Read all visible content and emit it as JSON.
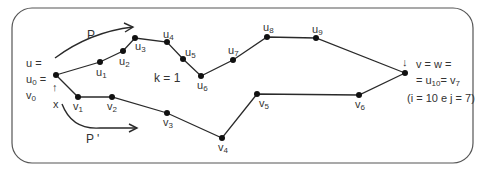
{
  "diagram": {
    "path_labels": {
      "p": "P",
      "p_prime": "P '"
    },
    "k_label": "k = 1",
    "start_label": {
      "line1": "u =",
      "line2_base": "u",
      "line2_sub": "0",
      "line2_suffix": " =",
      "line3_base": "v",
      "line3_sub": "0",
      "x_label": "x",
      "arrow": "↑"
    },
    "end_label": {
      "arrow": "↓",
      "line1": "v = w =",
      "line2_prefix": "= u",
      "line2_sub1": "10",
      "line2_mid": "= v",
      "line2_sub2": "7",
      "line3": "(i = 10 e j = 7)"
    },
    "nodes_u": [
      {
        "name": "u0",
        "base": "",
        "sub": "",
        "x": 56,
        "y": 75
      },
      {
        "name": "u1",
        "base": "u",
        "sub": "1",
        "x": 100,
        "y": 62
      },
      {
        "name": "u2",
        "base": "u",
        "sub": "2",
        "x": 123,
        "y": 51
      },
      {
        "name": "u3",
        "base": "u",
        "sub": "3",
        "x": 135,
        "y": 38
      },
      {
        "name": "u4",
        "base": "u",
        "sub": "4",
        "x": 167,
        "y": 42
      },
      {
        "name": "u5",
        "base": "u",
        "sub": "5",
        "x": 183,
        "y": 59
      },
      {
        "name": "u6",
        "base": "u",
        "sub": "6",
        "x": 201,
        "y": 76
      },
      {
        "name": "u7",
        "base": "u",
        "sub": "7",
        "x": 233,
        "y": 60
      },
      {
        "name": "u8",
        "base": "u",
        "sub": "8",
        "x": 267,
        "y": 37
      },
      {
        "name": "u9",
        "base": "u",
        "sub": "9",
        "x": 316,
        "y": 38
      },
      {
        "name": "u10",
        "base": "",
        "sub": "",
        "x": 405,
        "y": 73
      }
    ],
    "nodes_v": [
      {
        "name": "v1",
        "base": "v",
        "sub": "1",
        "x": 78,
        "y": 97
      },
      {
        "name": "v2",
        "base": "v",
        "sub": "2",
        "x": 112,
        "y": 97
      },
      {
        "name": "v3",
        "base": "v",
        "sub": "3",
        "x": 167,
        "y": 113
      },
      {
        "name": "v4",
        "base": "v",
        "sub": "4",
        "x": 222,
        "y": 138
      },
      {
        "name": "v5",
        "base": "v",
        "sub": "5",
        "x": 257,
        "y": 94
      },
      {
        "name": "v6",
        "base": "v",
        "sub": "6",
        "x": 359,
        "y": 95
      }
    ],
    "colors": {
      "stroke": "#2a2a2a",
      "frame": "#555555",
      "text": "#333333"
    }
  }
}
